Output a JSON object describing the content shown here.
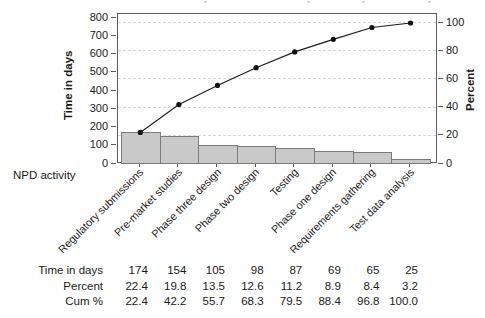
{
  "chart_data": {
    "type": "bar",
    "subtype": "pareto",
    "title": "",
    "categories": [
      "Regulatory submissions",
      "Pre-market studies",
      "Phase three design",
      "Phase two design",
      "Testing",
      "Phase one design",
      "Requirements gathering",
      "Test data analysis"
    ],
    "series": [
      {
        "name": "Time in days",
        "type": "bar",
        "axis": "left",
        "values": [
          174,
          154,
          105,
          98,
          87,
          69,
          65,
          25
        ]
      },
      {
        "name": "Cumulative percent",
        "type": "line",
        "axis": "right",
        "values": [
          22.4,
          42.2,
          55.7,
          68.3,
          79.5,
          88.4,
          96.8,
          100.0
        ]
      }
    ],
    "xlabel": "NPD activity",
    "ylabel": "Time in days",
    "ylabel_right": "Percent",
    "ylim_left": [
      0,
      800
    ],
    "ylim_right": [
      0,
      100
    ],
    "yticks_left": [
      0,
      100,
      200,
      300,
      400,
      500,
      600,
      700,
      800
    ],
    "yticks_right": [
      0,
      20,
      40,
      60,
      80,
      100
    ],
    "legend": "none",
    "grid": "horizontal dashed lines at right-axis ticks (20/40/60/80/100 percent)"
  },
  "table": {
    "rows": [
      {
        "label": "Time in days",
        "values": [
          "174",
          "154",
          "105",
          "98",
          "87",
          "69",
          "65",
          "25"
        ]
      },
      {
        "label": "Percent",
        "values": [
          "22.4",
          "19.8",
          "13.5",
          "12.6",
          "11.2",
          "8.9",
          "8.4",
          "3.2"
        ]
      },
      {
        "label": "Cum %",
        "values": [
          "22.4",
          "42.2",
          "55.7",
          "68.3",
          "79.5",
          "88.4",
          "96.8",
          "100.0"
        ]
      }
    ]
  },
  "colors": {
    "bar_fill": "#c9c9c9",
    "bar_border": "#7b7b7b",
    "line": "#1f1f1f",
    "marker": "#111111",
    "grid": "#d8d8d8",
    "axis": "#5c5c5c",
    "text": "#1a1a1a"
  }
}
